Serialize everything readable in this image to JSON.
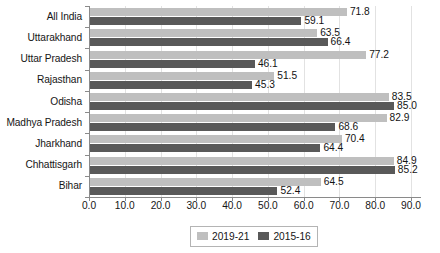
{
  "chart_data": {
    "type": "bar",
    "orientation": "horizontal",
    "title": "",
    "subtitle": "",
    "xlabel": "",
    "ylabel": "",
    "xlim": [
      0.0,
      90.0
    ],
    "xtick_step": 10.0,
    "xticks": [
      "0.0",
      "10.0",
      "20.0",
      "30.0",
      "40.0",
      "50.0",
      "60.0",
      "70.0",
      "80.0",
      "90.0"
    ],
    "xtick_values": [
      0.0,
      10.0,
      20.0,
      30.0,
      40.0,
      50.0,
      60.0,
      70.0,
      80.0,
      90.0
    ],
    "grid": true,
    "grid_axis": "x",
    "legend_position": "bottom",
    "categories": [
      "All India",
      "Uttarakhand",
      "Uttar Pradesh",
      "Rajasthan",
      "Odisha",
      "Madhya Pradesh",
      "Jharkhand",
      "Chhattisgarh",
      "Bihar"
    ],
    "series": [
      {
        "name": "2019-21",
        "color": "#bfbfbf",
        "values": [
          71.8,
          63.5,
          77.2,
          51.5,
          83.5,
          82.9,
          70.4,
          84.9,
          64.5
        ],
        "labels": [
          "71.8",
          "63.5",
          "77.2",
          "51.5",
          "83.5",
          "82.9",
          "70.4",
          "84.9",
          "64.5"
        ]
      },
      {
        "name": "2015-16",
        "color": "#595959",
        "values": [
          59.1,
          66.4,
          46.1,
          45.3,
          85.0,
          68.6,
          64.4,
          85.2,
          52.4
        ],
        "labels": [
          "59.1",
          "66.4",
          "46.1",
          "45.3",
          "85.0",
          "68.6",
          "64.4",
          "85.2",
          "52.4"
        ]
      }
    ]
  },
  "legend": {
    "items": [
      {
        "label": "2019-21",
        "color": "#bfbfbf"
      },
      {
        "label": "2015-16",
        "color": "#595959"
      }
    ]
  },
  "colors": {
    "series_2019_21": "#bfbfbf",
    "series_2015_16": "#595959",
    "axis": "#8a8a8a",
    "grid": "#e2e2e2",
    "text": "#161616",
    "background": "#ffffff"
  }
}
